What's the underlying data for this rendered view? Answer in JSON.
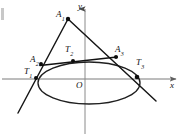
{
  "figure": {
    "width": 184,
    "height": 136,
    "background_color": "#ffffff",
    "stroke_color": "#1a1a1a",
    "axis_color": "#6b6b6b"
  },
  "axes": {
    "x_axis": {
      "label": "x",
      "label_x": 170,
      "label_y": 82,
      "y_position": 79,
      "x_start": 2,
      "x_end": 179,
      "arrow": "right"
    },
    "y_axis": {
      "label": "y",
      "label_x": 78,
      "label_y": 2,
      "x_position": 85,
      "y_start": 7,
      "y_end": 134,
      "arrow": "up"
    },
    "origin": {
      "label": "O",
      "label_x": 76,
      "label_y": 81,
      "x": 85,
      "y": 79
    }
  },
  "ellipse": {
    "center_x": 89,
    "center_y": 83,
    "radius_x": 51,
    "radius_y": 21,
    "stroke_width": 1.3
  },
  "points": [
    {
      "id": "A1",
      "letter": "A",
      "subscript": "1",
      "x": 68,
      "y": 19,
      "label_x": 56,
      "label_y": 10,
      "dot_radius": 2.1
    },
    {
      "id": "A2",
      "letter": "A",
      "subscript": "2",
      "x": 41,
      "y": 64,
      "label_x": 30,
      "label_y": 55,
      "dot_radius": 2.0
    },
    {
      "id": "A3",
      "letter": "A",
      "subscript": "3",
      "x": 116,
      "y": 57,
      "label_x": 115,
      "label_y": 45,
      "dot_radius": 2.0
    },
    {
      "id": "T1",
      "letter": "T",
      "subscript": "1",
      "x": 36,
      "y": 78,
      "label_x": 24,
      "label_y": 67,
      "dot_radius": 2.0
    },
    {
      "id": "T2",
      "letter": "T",
      "subscript": "2",
      "x": 73,
      "y": 61,
      "label_x": 65,
      "label_y": 45,
      "dot_radius": 2.0
    },
    {
      "id": "T3",
      "letter": "T",
      "subscript": "3",
      "x": 137,
      "y": 77,
      "label_x": 136,
      "label_y": 58,
      "dot_radius": 2.2
    }
  ],
  "lines": [
    {
      "id": "tangent-left",
      "name": "line-A1-T1-extended",
      "x1": 68,
      "y1": 19,
      "x2": 18,
      "y2": 113,
      "stroke_width": 1.4
    },
    {
      "id": "tangent-right",
      "name": "line-A1-T3-extended",
      "x1": 68,
      "y1": 19,
      "x2": 156,
      "y2": 101,
      "stroke_width": 1.4
    },
    {
      "id": "chord-a2a3",
      "name": "line-A2-A3",
      "x1": 40,
      "y1": 65,
      "x2": 117,
      "y2": 57,
      "stroke_width": 1.6
    }
  ],
  "edge_artifact": {
    "present": true,
    "x": 1,
    "y": 8,
    "width": 3,
    "height": 12
  }
}
